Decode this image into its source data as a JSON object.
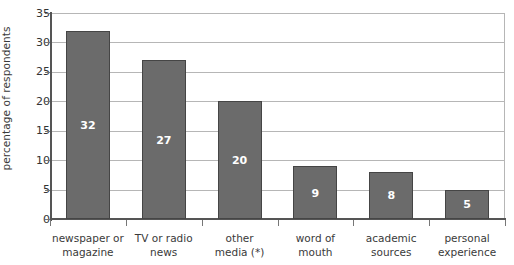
{
  "chart_data": {
    "type": "bar",
    "title": "",
    "subtitle": "",
    "xlabel": "",
    "ylabel": "percentage of respondents",
    "ylim": [
      0,
      35
    ],
    "ytick_values": [
      0,
      5,
      10,
      15,
      20,
      25,
      30,
      35
    ],
    "ytick_labels": [
      "0",
      "5",
      "10",
      "15",
      "20",
      "25",
      "30",
      "35"
    ],
    "grid": "horizontal",
    "legend": "none",
    "orientation": "vertical",
    "categories": [
      "newspaper or magazine",
      "TV or radio news",
      "other media (*)",
      "word of mouth",
      "academic sources",
      "personal experience"
    ],
    "category_lines": [
      [
        "newspaper or",
        "magazine"
      ],
      [
        "TV or radio",
        "news"
      ],
      [
        "other",
        "media (*)"
      ],
      [
        "word of mouth",
        ""
      ],
      [
        "academic",
        "sources"
      ],
      [
        "personal",
        "experience"
      ]
    ],
    "values": [
      32,
      27,
      20,
      9,
      8,
      5
    ],
    "value_labels": [
      "32",
      "27",
      "20",
      "9",
      "8",
      "5"
    ],
    "colors": {
      "bar_fill": "#6b6b6b",
      "bar_border": "#454545",
      "value_label": "#ffffff",
      "gridline": "#b6b6b6",
      "axis_line": "#555555",
      "tick_text": "#333333",
      "axis_title": "#3a3a3a",
      "background": "#ffffff"
    }
  }
}
